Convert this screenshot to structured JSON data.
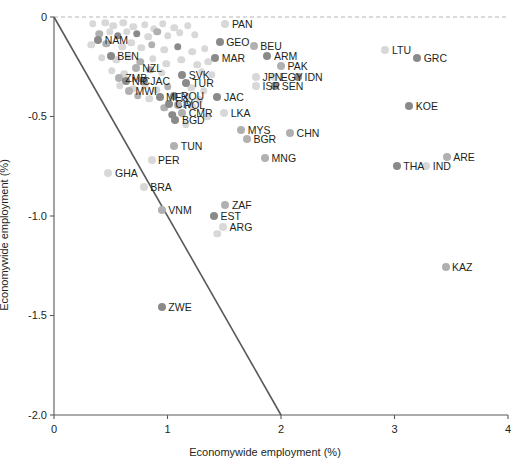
{
  "chart_data": {
    "type": "scatter",
    "title": "",
    "xlabel": "Economywide employment (%)",
    "ylabel": "Economywide employment (%)",
    "xlim": [
      0,
      4
    ],
    "ylim": [
      -2.0,
      0
    ],
    "xticks": [
      "0",
      "1",
      "2",
      "3",
      "4"
    ],
    "xtick_values": [
      0,
      1,
      2,
      3,
      4
    ],
    "yticks": [
      "0",
      "-0.5",
      "-1.0",
      "-1.5",
      "-2.0"
    ],
    "ytick_values": [
      0,
      -0.5,
      -1.0,
      -1.5,
      -2.0
    ],
    "grid": false,
    "legend": "none",
    "reference_lines": [
      {
        "name": "zero-line",
        "style": "dashed",
        "orientation": "horizontal",
        "y": 0,
        "color": "#b5b5b5"
      },
      {
        "name": "diagonal-line",
        "style": "solid",
        "from": [
          0,
          0
        ],
        "to": [
          2,
          -2.0
        ],
        "color": "#595959",
        "slope": -1
      }
    ],
    "colors": {
      "dark_marker": "#8a8a8a",
      "mid_marker": "#b0b0b0",
      "light_marker": "#d8d8d8",
      "axis": "#595959",
      "text": "#231f20"
    },
    "points": [
      {
        "label": "PAN",
        "x": 1.51,
        "y": -0.035,
        "shade": "light",
        "label_side": "right"
      },
      {
        "label": "GEO",
        "x": 1.46,
        "y": -0.125,
        "shade": "dark",
        "label_side": "right"
      },
      {
        "label": "BEU",
        "x": 1.76,
        "y": -0.145,
        "shade": "mid",
        "label_side": "right"
      },
      {
        "label": "NAM",
        "x": 0.39,
        "y": -0.115,
        "shade": "dark",
        "label_side": "right"
      },
      {
        "label": "BEN",
        "x": 0.5,
        "y": -0.195,
        "shade": "dark",
        "label_side": "right"
      },
      {
        "label": "ARM",
        "x": 1.88,
        "y": -0.195,
        "shade": "dark",
        "label_side": "right"
      },
      {
        "label": "MAR",
        "x": 1.42,
        "y": -0.205,
        "shade": "dark",
        "label_side": "right"
      },
      {
        "label": "NZL",
        "x": 0.72,
        "y": -0.255,
        "shade": "mid",
        "label_side": "right"
      },
      {
        "label": "PAK",
        "x": 2.0,
        "y": -0.245,
        "shade": "mid",
        "label_side": "right"
      },
      {
        "label": "LTU",
        "x": 2.92,
        "y": -0.165,
        "shade": "light",
        "label_side": "right"
      },
      {
        "label": "GRC",
        "x": 3.2,
        "y": -0.205,
        "shade": "dark",
        "label_side": "right"
      },
      {
        "label": "ZMB",
        "x": 0.57,
        "y": -0.305,
        "shade": "mid",
        "label_side": "right"
      },
      {
        "label": "NIC",
        "x": 0.63,
        "y": -0.32,
        "shade": "dark",
        "label_side": "right"
      },
      {
        "label": "JAC",
        "x": 0.79,
        "y": -0.32,
        "shade": "dark",
        "label_side": "right"
      },
      {
        "label": "SVK",
        "x": 1.13,
        "y": -0.29,
        "shade": "dark",
        "label_side": "right"
      },
      {
        "label": "TUR",
        "x": 1.16,
        "y": -0.33,
        "shade": "dark",
        "label_side": "right"
      },
      {
        "label": "JPN",
        "x": 1.78,
        "y": -0.3,
        "shade": "light",
        "label_side": "right"
      },
      {
        "label": "EGY",
        "x": 1.94,
        "y": -0.3,
        "shade": "light",
        "label_side": "right"
      },
      {
        "label": "IDN",
        "x": 2.15,
        "y": -0.3,
        "shade": "dark",
        "label_side": "right"
      },
      {
        "label": "ISR",
        "x": 1.78,
        "y": -0.345,
        "shade": "light",
        "label_side": "right"
      },
      {
        "label": "SEN",
        "x": 1.95,
        "y": -0.345,
        "shade": "dark",
        "label_side": "right"
      },
      {
        "label": "MWI",
        "x": 0.66,
        "y": -0.37,
        "shade": "mid",
        "label_side": "right"
      },
      {
        "label": "MEX",
        "x": 0.93,
        "y": -0.4,
        "shade": "dark",
        "label_side": "right"
      },
      {
        "label": "ROU",
        "x": 1.06,
        "y": -0.395,
        "shade": "dark",
        "label_side": "right"
      },
      {
        "label": "JAC",
        "x": 1.44,
        "y": -0.4,
        "shade": "dark",
        "label_side": "right"
      },
      {
        "label": "CIV",
        "x": 1.01,
        "y": -0.435,
        "shade": "dark",
        "label_side": "right"
      },
      {
        "label": "POL",
        "x": 1.09,
        "y": -0.44,
        "shade": "mid",
        "label_side": "right"
      },
      {
        "label": "KOE",
        "x": 3.13,
        "y": -0.445,
        "shade": "dark",
        "label_side": "right"
      },
      {
        "label": "CMR",
        "x": 1.13,
        "y": -0.48,
        "shade": "mid",
        "label_side": "right"
      },
      {
        "label": "LKA",
        "x": 1.5,
        "y": -0.48,
        "shade": "light",
        "label_side": "right"
      },
      {
        "label": "BGD",
        "x": 1.07,
        "y": -0.52,
        "shade": "dark",
        "label_side": "right"
      },
      {
        "label": "MYS",
        "x": 1.65,
        "y": -0.57,
        "shade": "mid",
        "label_side": "right"
      },
      {
        "label": "CHN",
        "x": 2.08,
        "y": -0.585,
        "shade": "mid",
        "label_side": "right"
      },
      {
        "label": "BGR",
        "x": 1.7,
        "y": -0.615,
        "shade": "mid",
        "label_side": "right"
      },
      {
        "label": "TUN",
        "x": 1.06,
        "y": -0.65,
        "shade": "mid",
        "label_side": "right"
      },
      {
        "label": "ARE",
        "x": 3.46,
        "y": -0.705,
        "shade": "mid",
        "label_side": "right"
      },
      {
        "label": "MNG",
        "x": 1.86,
        "y": -0.71,
        "shade": "mid",
        "label_side": "right"
      },
      {
        "label": "THA",
        "x": 3.02,
        "y": -0.75,
        "shade": "dark",
        "label_side": "right"
      },
      {
        "label": "IND",
        "x": 3.28,
        "y": -0.75,
        "shade": "light",
        "label_side": "right"
      },
      {
        "label": "PER",
        "x": 0.86,
        "y": -0.72,
        "shade": "light",
        "label_side": "right"
      },
      {
        "label": "GHA",
        "x": 0.48,
        "y": -0.785,
        "shade": "light",
        "label_side": "right"
      },
      {
        "label": "BRA",
        "x": 0.79,
        "y": -0.855,
        "shade": "light",
        "label_side": "right"
      },
      {
        "label": "ZAF",
        "x": 1.51,
        "y": -0.945,
        "shade": "mid",
        "label_side": "right"
      },
      {
        "label": "VNM",
        "x": 0.95,
        "y": -0.97,
        "shade": "mid",
        "label_side": "right"
      },
      {
        "label": "EST",
        "x": 1.41,
        "y": -1.0,
        "shade": "dark",
        "label_side": "right"
      },
      {
        "label": "ARG",
        "x": 1.49,
        "y": -1.055,
        "shade": "light",
        "label_side": "right"
      },
      {
        "label": "KAZ",
        "x": 3.45,
        "y": -1.255,
        "shade": "mid",
        "label_side": "right"
      },
      {
        "label": "ZWE",
        "x": 0.95,
        "y": -1.455,
        "shade": "dark",
        "label_side": "right"
      }
    ],
    "unlabeled_points": [
      {
        "x": 0.34,
        "y": -0.035,
        "shade": "light"
      },
      {
        "x": 0.45,
        "y": -0.03,
        "shade": "light"
      },
      {
        "x": 0.52,
        "y": -0.045,
        "shade": "light"
      },
      {
        "x": 0.61,
        "y": -0.03,
        "shade": "light"
      },
      {
        "x": 0.7,
        "y": -0.05,
        "shade": "light"
      },
      {
        "x": 0.8,
        "y": -0.04,
        "shade": "light"
      },
      {
        "x": 0.88,
        "y": -0.06,
        "shade": "light"
      },
      {
        "x": 0.96,
        "y": -0.035,
        "shade": "light"
      },
      {
        "x": 1.06,
        "y": -0.055,
        "shade": "light"
      },
      {
        "x": 1.18,
        "y": -0.045,
        "shade": "light"
      },
      {
        "x": 0.4,
        "y": -0.085,
        "shade": "mid"
      },
      {
        "x": 0.49,
        "y": -0.075,
        "shade": "light"
      },
      {
        "x": 0.56,
        "y": -0.095,
        "shade": "dark"
      },
      {
        "x": 0.64,
        "y": -0.075,
        "shade": "light"
      },
      {
        "x": 0.73,
        "y": -0.085,
        "shade": "dark"
      },
      {
        "x": 0.83,
        "y": -0.1,
        "shade": "light"
      },
      {
        "x": 0.91,
        "y": -0.075,
        "shade": "mid"
      },
      {
        "x": 1.0,
        "y": -0.095,
        "shade": "light"
      },
      {
        "x": 1.11,
        "y": -0.08,
        "shade": "light"
      },
      {
        "x": 1.24,
        "y": -0.09,
        "shade": "light"
      },
      {
        "x": 0.33,
        "y": -0.14,
        "shade": "light"
      },
      {
        "x": 0.46,
        "y": -0.135,
        "shade": "mid"
      },
      {
        "x": 0.6,
        "y": -0.15,
        "shade": "light"
      },
      {
        "x": 0.68,
        "y": -0.13,
        "shade": "light"
      },
      {
        "x": 0.77,
        "y": -0.155,
        "shade": "light"
      },
      {
        "x": 0.86,
        "y": -0.14,
        "shade": "mid"
      },
      {
        "x": 0.97,
        "y": -0.165,
        "shade": "light"
      },
      {
        "x": 1.09,
        "y": -0.15,
        "shade": "dark"
      },
      {
        "x": 1.22,
        "y": -0.175,
        "shade": "light"
      },
      {
        "x": 1.33,
        "y": -0.16,
        "shade": "light"
      },
      {
        "x": 0.42,
        "y": -0.205,
        "shade": "light"
      },
      {
        "x": 0.55,
        "y": -0.215,
        "shade": "light"
      },
      {
        "x": 0.66,
        "y": -0.2,
        "shade": "light"
      },
      {
        "x": 0.76,
        "y": -0.225,
        "shade": "mid"
      },
      {
        "x": 0.87,
        "y": -0.21,
        "shade": "light"
      },
      {
        "x": 0.99,
        "y": -0.235,
        "shade": "light"
      },
      {
        "x": 1.12,
        "y": -0.215,
        "shade": "light"
      },
      {
        "x": 1.26,
        "y": -0.24,
        "shade": "light"
      },
      {
        "x": 1.36,
        "y": -0.225,
        "shade": "light"
      },
      {
        "x": 0.51,
        "y": -0.27,
        "shade": "light"
      },
      {
        "x": 0.62,
        "y": -0.285,
        "shade": "light"
      },
      {
        "x": 0.85,
        "y": -0.265,
        "shade": "mid"
      },
      {
        "x": 0.95,
        "y": -0.28,
        "shade": "light"
      },
      {
        "x": 1.3,
        "y": -0.275,
        "shade": "light"
      },
      {
        "x": 1.39,
        "y": -0.29,
        "shade": "light"
      },
      {
        "x": 0.58,
        "y": -0.345,
        "shade": "light"
      },
      {
        "x": 0.7,
        "y": -0.36,
        "shade": "light"
      },
      {
        "x": 0.8,
        "y": -0.345,
        "shade": "light"
      },
      {
        "x": 0.9,
        "y": -0.365,
        "shade": "light"
      },
      {
        "x": 1.0,
        "y": -0.35,
        "shade": "mid"
      },
      {
        "x": 1.21,
        "y": -0.355,
        "shade": "light"
      },
      {
        "x": 1.32,
        "y": -0.37,
        "shade": "light"
      },
      {
        "x": 0.74,
        "y": -0.395,
        "shade": "mid"
      },
      {
        "x": 0.84,
        "y": -0.41,
        "shade": "light"
      },
      {
        "x": 1.18,
        "y": -0.4,
        "shade": "light"
      },
      {
        "x": 1.28,
        "y": -0.415,
        "shade": "light"
      },
      {
        "x": 0.97,
        "y": -0.455,
        "shade": "mid"
      },
      {
        "x": 1.22,
        "y": -0.45,
        "shade": "light"
      },
      {
        "x": 1.04,
        "y": -0.49,
        "shade": "dark"
      },
      {
        "x": 1.35,
        "y": -0.5,
        "shade": "light"
      },
      {
        "x": 1.16,
        "y": -0.54,
        "shade": "light"
      },
      {
        "x": 1.44,
        "y": -1.09,
        "shade": "light"
      }
    ]
  }
}
